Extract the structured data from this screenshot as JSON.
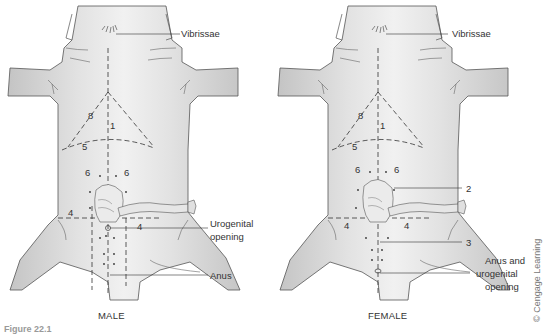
{
  "panels": [
    {
      "id": "male",
      "caption": "MALE",
      "labels": {
        "vibrissae": "Vibrissae",
        "urogenital_1": "Urogenital",
        "urogenital_2": "opening",
        "anus": "Anus"
      },
      "incision_numbers": {
        "n8": "8",
        "n1": "1",
        "n5": "5",
        "n6a": "6",
        "n6b": "6",
        "n4a": "4",
        "n4b": "4"
      }
    },
    {
      "id": "female",
      "caption": "FEMALE",
      "labels": {
        "vibrissae": "Vibrissae",
        "n2": "2",
        "n3": "3",
        "anus_1": "Anus and",
        "anus_2": "urogenital",
        "anus_3": "opening"
      },
      "incision_numbers": {
        "n8": "8",
        "n1": "1",
        "n5": "5",
        "n6a": "6",
        "n6b": "6",
        "n4a": "4",
        "n4b": "4"
      }
    }
  ],
  "credit": "© Cengage Learning",
  "figure_label": "Figure 22.1",
  "colors": {
    "body_fill": "#d9d9d9",
    "outline": "#555555",
    "dash": "#333333",
    "text": "#333333"
  }
}
